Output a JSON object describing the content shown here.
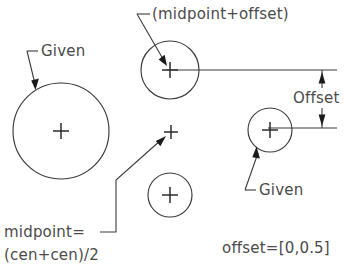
{
  "diagram": {
    "stroke_color": "#3a3a3a",
    "text_color": "#4a4a4a",
    "background": "#ffffff",
    "labels": {
      "given_left": "Given",
      "given_right": "Given",
      "midpoint_offset": "(midpoint+offset)",
      "offset_dimension": "Offset",
      "midpoint_formula_line1": "midpoint=",
      "midpoint_formula_line2": "(cen+cen)/2",
      "offset_value": "offset=[0,0.5]"
    },
    "shapes": {
      "large_circle": {
        "cx": 61,
        "cy": 131,
        "r": 48,
        "name": "given-large-circle"
      },
      "top_circle": {
        "cx": 170,
        "cy": 70,
        "r": 29,
        "name": "midpoint-offset-circle"
      },
      "bottom_circle": {
        "cx": 170,
        "cy": 195,
        "r": 22,
        "name": "lower-small-circle"
      },
      "right_circle": {
        "cx": 270,
        "cy": 130,
        "r": 22,
        "name": "given-right-circle"
      },
      "midpoint_cross": {
        "cx": 171,
        "cy": 132,
        "name": "midpoint-marker"
      }
    },
    "dimension": {
      "label": "Offset",
      "axis_x": 322,
      "top_y": 70,
      "bottom_y": 128,
      "value": "0.5"
    }
  }
}
